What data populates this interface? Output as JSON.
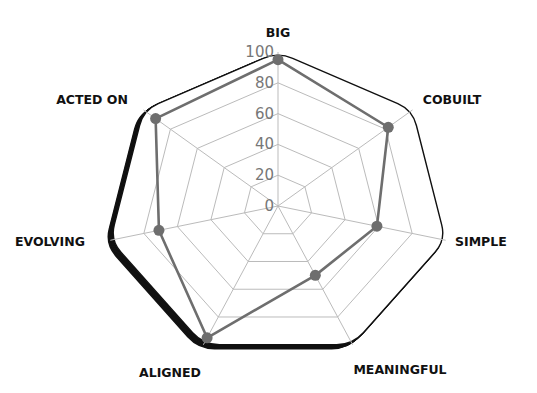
{
  "chart_data": {
    "type": "radar",
    "title": "",
    "categories": [
      "BIG",
      "COBUILT",
      "SIMPLE",
      "MEANINGFUL",
      "ALIGNED",
      "EVOLVING",
      "ACTED ON"
    ],
    "series": [
      {
        "name": "Score",
        "values": [
          95,
          82,
          59,
          50,
          95,
          71,
          91
        ]
      }
    ],
    "r_ticks": [
      "0",
      "20",
      "40",
      "60",
      "80",
      "100"
    ],
    "rlim": [
      0,
      100
    ],
    "grid": true,
    "legend": null
  },
  "style": {
    "grid_color": "#bbbbbb",
    "series_color": "#6e6e6e",
    "outline_color": "#111111",
    "label_color": "#111111",
    "tick_color": "#777777"
  }
}
